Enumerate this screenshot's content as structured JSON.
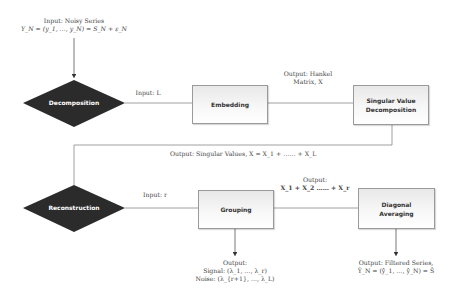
{
  "diagram": {
    "input": {
      "line1": "Input: Noisy Series",
      "line2": "Y_N = (y_1, …, y_N) = S_N + ε_N"
    },
    "nodes": {
      "decomposition": {
        "label": "Decomposition",
        "shape": "diamond",
        "color": "#2b2b2b"
      },
      "embedding": {
        "label": "Embedding",
        "shape": "box"
      },
      "svd": {
        "label_line1": "Singular Value",
        "label_line2": "Decomposition",
        "shape": "box"
      },
      "reconstruction": {
        "label": "Reconstruction",
        "shape": "diamond",
        "color": "#2b2b2b"
      },
      "grouping": {
        "label": "Grouping",
        "shape": "box"
      },
      "diagonal_averaging": {
        "label_line1": "Diagonal",
        "label_line2": "Averaging",
        "shape": "box"
      }
    },
    "edge_labels": {
      "input_L": "Input: L",
      "hankel_line1": "Output: Hankel",
      "hankel_line2": "Matrix, X",
      "singular_values": "Output: Singular Values, X = X_1 + …… + X_L",
      "input_r": "Input: r",
      "grouping_output_line1": "Output:",
      "grouping_output_line2": "X_1 + X_2 …… + X_r"
    },
    "outputs": {
      "grouping": {
        "line1": "Output:",
        "line2": "Signal: (λ_1, …, λ_r)",
        "line3": "Noise: (λ_{r+1}, …, λ_L)"
      },
      "diagonal_averaging": {
        "line1": "Output: Filtered Series,",
        "line2": "Ŷ_N = (ŷ_1, …, ŷ_N) = Ŝ"
      }
    }
  }
}
